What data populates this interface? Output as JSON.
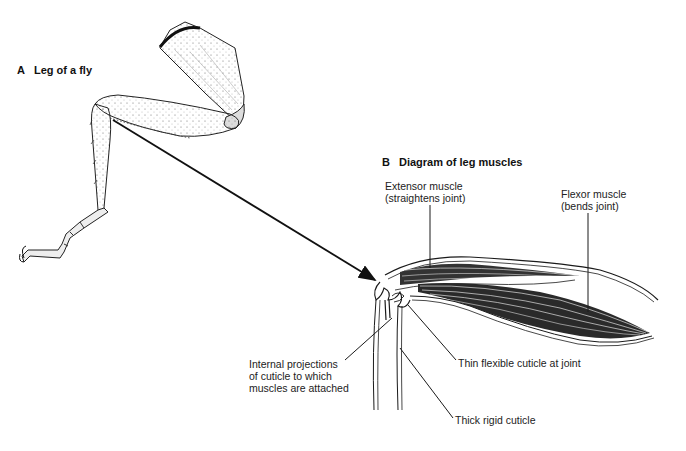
{
  "panel_a": {
    "letter": "A",
    "title": "Leg of a fly"
  },
  "panel_b": {
    "letter": "B",
    "title": "Diagram of leg muscles",
    "labels": {
      "extensor_line1": "Extensor muscle",
      "extensor_line2": "(straightens joint)",
      "flexor_line1": "Flexor muscle",
      "flexor_line2": "(bends joint)",
      "projections_line1": "Internal  projections",
      "projections_line2": "of cuticle to which",
      "projections_line3": "muscles are attached",
      "thin_cuticle": "Thin flexible cuticle at joint",
      "thick_cuticle": "Thick rigid cuticle"
    }
  },
  "colors": {
    "ink": "#1a1a1a",
    "background": "#ffffff"
  }
}
